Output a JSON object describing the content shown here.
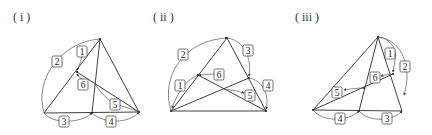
{
  "figures": [
    {
      "id": "i",
      "title": "( i )",
      "labels": [
        "1",
        "2",
        "3",
        "4",
        "5",
        "6"
      ]
    },
    {
      "id": "ii",
      "title": "( ii )",
      "labels": [
        "1",
        "2",
        "3",
        "4",
        "5",
        "6"
      ]
    },
    {
      "id": "iii",
      "title": "( iii )",
      "labels": [
        "1",
        "2",
        "3",
        "4",
        "5",
        "6"
      ]
    }
  ],
  "colors": {
    "stroke": "#2a2a2a",
    "arc": "#555555",
    "background": "#ffffff"
  }
}
